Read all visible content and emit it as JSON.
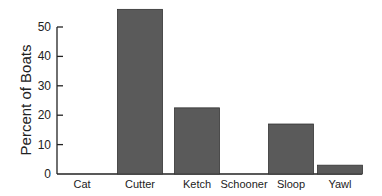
{
  "chart_data": {
    "type": "bar",
    "title": "",
    "xlabel": "",
    "ylabel": "Percent of Boats",
    "categories": [
      "Cat",
      "Cutter",
      "Ketch",
      "Schooner",
      "Sloop",
      "Yawl"
    ],
    "values": [
      0,
      56,
      22.5,
      0,
      17,
      3
    ],
    "ylim": [
      0,
      50
    ],
    "yticks": [
      0,
      10,
      20,
      30,
      40,
      50
    ],
    "grid": false,
    "legend": null,
    "bar_color": "#5a5a5a"
  }
}
